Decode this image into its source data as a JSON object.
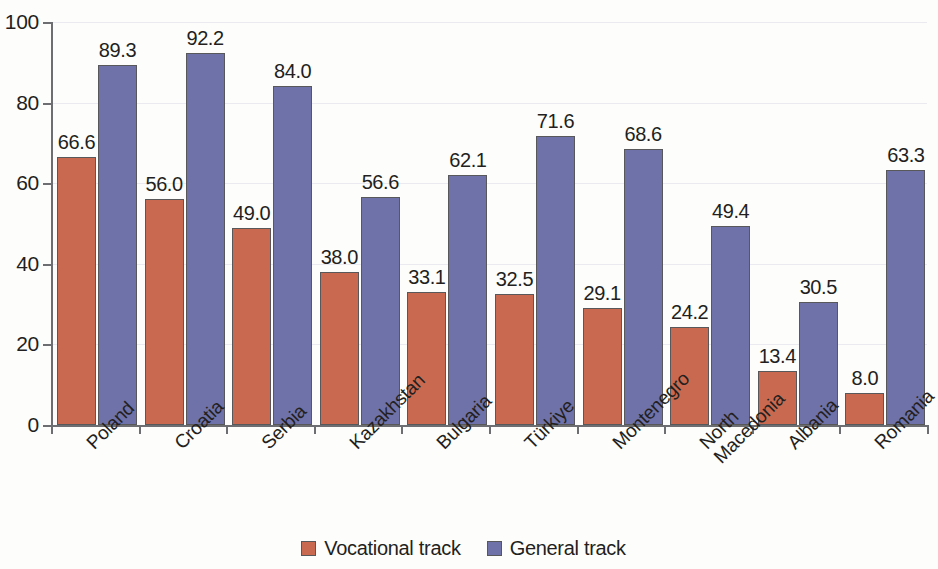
{
  "chart_data": {
    "type": "bar",
    "title": "",
    "subtitle": "",
    "xlabel": "",
    "ylabel": "",
    "ylim": [
      0,
      100
    ],
    "yticks": [
      0,
      20,
      40,
      60,
      80,
      100
    ],
    "grid": true,
    "legend_position": "bottom-center",
    "categories": [
      "Poland",
      "Croatia",
      "Serbia",
      "Kazakhstan",
      "Bulgaria",
      "Türkiye",
      "Montenegro",
      "North Macedonia",
      "Albania",
      "Romania"
    ],
    "series": [
      {
        "name": "Vocational track",
        "color": "#c96a50",
        "values": [
          66.6,
          56.0,
          49.0,
          38.0,
          33.1,
          32.5,
          29.1,
          24.2,
          13.4,
          8.0
        ],
        "labels": [
          "66.6",
          "56.0",
          "49.0",
          "38.0",
          "33.1",
          "32.5",
          "29.1",
          "24.2",
          "13.4",
          "8.0"
        ]
      },
      {
        "name": "General track",
        "color": "#6e72a8",
        "values": [
          89.3,
          92.2,
          84.0,
          56.6,
          62.1,
          71.6,
          68.6,
          49.4,
          30.5,
          63.3
        ],
        "labels": [
          "89.3",
          "92.2",
          "84.0",
          "56.6",
          "62.1",
          "71.6",
          "68.6",
          "49.4",
          "30.5",
          "63.3"
        ]
      }
    ]
  },
  "axis": {
    "y_tick_labels": [
      "100",
      "80",
      "60",
      "40",
      "20",
      "0"
    ]
  },
  "legend": {
    "items": [
      {
        "label": "Vocational track",
        "color": "#c96a50"
      },
      {
        "label": "General track",
        "color": "#6e72a8"
      }
    ]
  },
  "category_label_lines": [
    [
      "Poland"
    ],
    [
      "Croatia"
    ],
    [
      "Serbia"
    ],
    [
      "Kazakhstan"
    ],
    [
      "Bulgaria"
    ],
    [
      "Türkiye"
    ],
    [
      "Montenegro"
    ],
    [
      "North",
      "Macedonia"
    ],
    [
      "Albania"
    ],
    [
      "Romania"
    ]
  ]
}
